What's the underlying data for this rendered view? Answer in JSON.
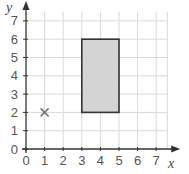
{
  "chart_data": {
    "type": "scatter",
    "title": "",
    "xlabel": "x",
    "ylabel": "y",
    "xlim": [
      0,
      7
    ],
    "ylim": [
      0,
      7
    ],
    "grid": true,
    "x_ticks": [
      "0",
      "1",
      "2",
      "3",
      "4",
      "5",
      "6",
      "7"
    ],
    "y_ticks": [
      "0",
      "1",
      "2",
      "3",
      "4",
      "5",
      "6",
      "7"
    ],
    "points": [
      {
        "label": "cross",
        "x": 1,
        "y": 2,
        "marker": "x"
      }
    ],
    "shapes": [
      {
        "type": "rectangle",
        "x0": 3,
        "y0": 2,
        "x1": 5,
        "y1": 6,
        "fill": "#d4d4d4",
        "stroke": "#333333"
      }
    ]
  },
  "colors": {
    "grid": "#d9d9d9",
    "axis": "#333333",
    "rect_fill": "#d4d4d4",
    "rect_stroke": "#333333",
    "marker": "#777777"
  }
}
